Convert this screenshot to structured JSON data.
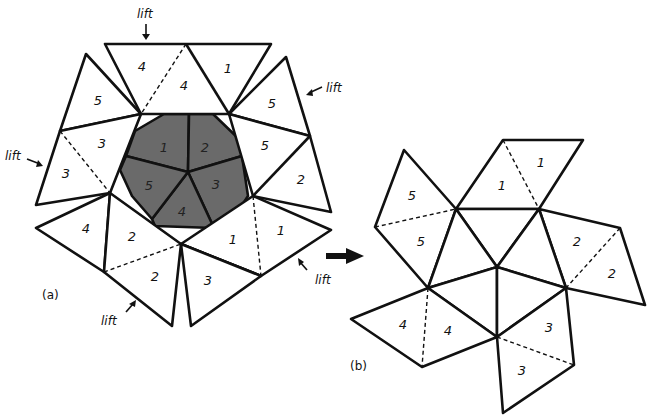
{
  "figure": {
    "panel_a": {
      "caption": "(a)",
      "center_labels": [
        "1",
        "2",
        "3",
        "4",
        "5"
      ],
      "outer_labels": {
        "top_left": "4",
        "top_mid": "4",
        "top_right": "1",
        "upper_left": "5",
        "left_a": "3",
        "left_b": "3",
        "upper_right": "5",
        "right_a": "5",
        "right_b": "2",
        "lower_left": "4",
        "bottom_left_a": "2",
        "bottom_left_b": "2",
        "bottom_right_a": "1",
        "bottom_right_b": "1",
        "bottom_mid": "3"
      },
      "lift_label": "lift",
      "lift_count": 5
    },
    "panel_b": {
      "caption": "(b)",
      "labels": {
        "top_a": "1",
        "top_b": "1",
        "left_a": "5",
        "left_b": "5",
        "right_a": "2",
        "right_b": "2",
        "bottom_left_a": "4",
        "bottom_left_b": "4",
        "bottom_right_a": "3",
        "bottom_right_b": "3"
      }
    },
    "transition_arrow": "right-arrow"
  }
}
